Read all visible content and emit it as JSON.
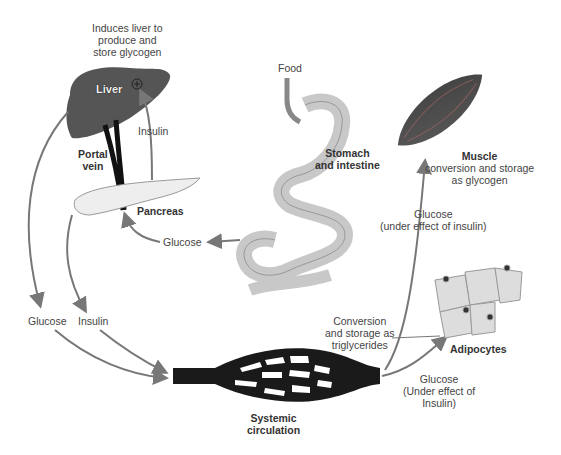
{
  "labels": {
    "induces": [
      "Induces liver to",
      "produce and",
      "store glycogen"
    ],
    "liver": "Liver",
    "insulin_top": "Insulin",
    "portal_vein": [
      "Portal",
      "vein"
    ],
    "pancreas": "Pancreas",
    "food": "Food",
    "stomach": [
      "Stomach",
      "and intestine"
    ],
    "glucose_gut": "Glucose",
    "glucose_left": "Glucose",
    "insulin_left": "Insulin",
    "systemic": [
      "Systemic",
      "circulation"
    ],
    "muscle_title": "Muscle",
    "muscle_desc": [
      "conversion and storage",
      "as glycogen"
    ],
    "glucose_muscle": [
      "Glucose",
      "(under effect of insulin)"
    ],
    "conversion": [
      "Conversion",
      "and storage as",
      "triglycerides"
    ],
    "adipocytes": "Adipocytes",
    "glucose_adipo": [
      "Glucose",
      "(Under effect of",
      "Insulin)"
    ]
  },
  "colors": {
    "liver": "#555555",
    "organ_fill": "#c8c8c8",
    "arrow": "#777777",
    "vessel": "#1a1a1a"
  }
}
